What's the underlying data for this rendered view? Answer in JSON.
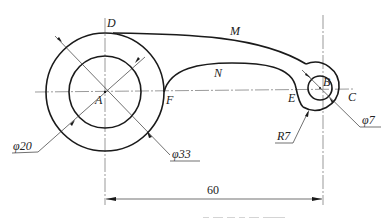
{
  "drawing": {
    "points": {
      "A": "A",
      "B": "B",
      "C": "C",
      "D": "D",
      "E": "E",
      "F": "F",
      "M": "M",
      "N": "N"
    },
    "dimensions": {
      "phi20": "φ20",
      "phi33": "φ33",
      "phi7": "φ7",
      "r7": "R7",
      "center_distance": "60"
    },
    "geometry": {
      "center_A": [
        105,
        92
      ],
      "center_B": [
        320,
        88
      ],
      "outer_circle_A_radius": 59,
      "inner_circle_A_radius": 36,
      "small_circle_B_radius": 12,
      "arc_B_radius": 24
    },
    "colors": {
      "line": "#1a1a1a",
      "thin_line": "#333333",
      "background": "#ffffff"
    }
  }
}
